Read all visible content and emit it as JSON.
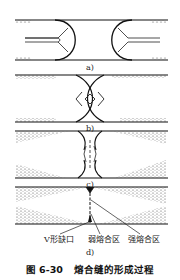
{
  "figure": {
    "caption_number": "图 6-30",
    "caption_title": "熔合缝的形成过程",
    "panels": [
      {
        "id": "a",
        "label": "a)",
        "description": "两股熔体流动前沿相向流动"
      },
      {
        "id": "b",
        "label": "b)",
        "description": "两股流动前沿相遇"
      },
      {
        "id": "c",
        "label": "c)",
        "description": "熔合过程"
      },
      {
        "id": "d",
        "label": "d)",
        "description": "熔合缝形成"
      }
    ],
    "annotations": [
      {
        "text": "V形缺口"
      },
      {
        "text": "弱熔合区"
      },
      {
        "text": "强熔合区"
      }
    ]
  }
}
